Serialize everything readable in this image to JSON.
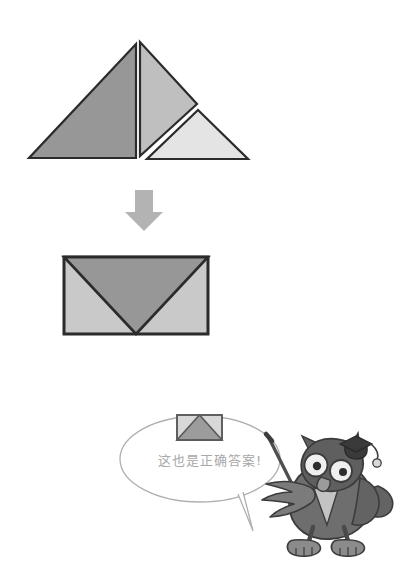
{
  "page": {
    "background_color": "#ffffff",
    "width": 400,
    "height": 576
  },
  "palette": {
    "outline": "#2b2b2b",
    "dark_gray": "#979797",
    "mid_gray": "#bfbfbf",
    "light_gray": "#e4e4e4",
    "arrow_gray": "#b3b3b3",
    "bubble_stroke": "#b0b0b0",
    "text_gray": "#a8a8a8",
    "owl_body": "#6e6e6e",
    "owl_dark": "#4a4a4a",
    "owl_light": "#9b9b9b",
    "owl_eye_white": "#efefef",
    "cap_black": "#3a3a3a"
  },
  "pieces_row": {
    "label": "three-triangle-pieces",
    "pieces": [
      {
        "name": "large-dark-triangle",
        "fill": "#979797",
        "points": "29,158 136,158 136,44",
        "right_angle": "bottom-right"
      },
      {
        "name": "medium-mid-triangle",
        "fill": "#bfbfbf",
        "points": "140,42 140,155 196,104",
        "right_angle": "left-vertical"
      },
      {
        "name": "small-light-triangle",
        "fill": "#e4e4e4",
        "points": "147,159 248,159 198,109",
        "right_angle": "bottom-right"
      }
    ]
  },
  "arrow": {
    "name": "down-arrow",
    "fill": "#b3b3b3",
    "direction": "down"
  },
  "envelope_big": {
    "name": "envelope-result-shape",
    "rect": {
      "x": 64,
      "y": 257,
      "w": 144,
      "h": 77
    },
    "border_color": "#2b2b2b",
    "flap_fill": "#979797",
    "side_fill": "#c9c9c9",
    "flap_direction": "down"
  },
  "speech_bubble": {
    "name": "owl-speech-bubble",
    "stroke": "#b0b0b0",
    "fill": "#ffffff",
    "text": "这也是正确答案!",
    "ellipse": {
      "cx": 200,
      "cy": 459,
      "rx": 80,
      "ry": 43
    },
    "tail": "tail points down-right toward the owl"
  },
  "envelope_small": {
    "name": "envelope-mini-shape",
    "rect": {
      "x": 177,
      "y": 415,
      "w": 45,
      "h": 25
    },
    "border_color": "#5a5a5a",
    "flap_fill": "#9c9c9c",
    "side_fill": "#d8d8d8",
    "flap_direction": "up"
  },
  "owl": {
    "name": "owl-teacher-character",
    "accessories": [
      "graduation-cap",
      "pointer-stick",
      "bow-tie"
    ],
    "body_fill": "#6e6e6e",
    "dark_fill": "#4a4a4a",
    "cap_fill": "#3a3a3a",
    "eye_fill": "#efefef",
    "pointer_color": "#4f4f4f"
  }
}
